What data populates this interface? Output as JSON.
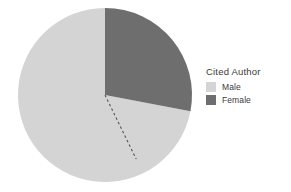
{
  "chart_data": {
    "type": "pie",
    "title": "",
    "legend_title": "Cited Author",
    "legend_position": "right",
    "categories": [
      "Male",
      "Female"
    ],
    "values": [
      72,
      28
    ],
    "unit": "percent",
    "colors": [
      "#d4d4d4",
      "#6e6e6e"
    ],
    "start_angle_deg": 0,
    "direction": "clockwise",
    "annotation": {
      "type": "dashed-radius-line",
      "angle_deg": 154,
      "color": "#555555",
      "style": "dashed"
    },
    "geometry": {
      "center_x": 105,
      "center_y": 95,
      "radius": 87
    }
  },
  "legend": {
    "title": "Cited Author",
    "items": [
      {
        "label": "Male",
        "color": "#d4d4d4"
      },
      {
        "label": "Female",
        "color": "#6e6e6e"
      }
    ]
  },
  "colors": {
    "background": "#ffffff",
    "male": "#d4d4d4",
    "female": "#6e6e6e",
    "text": "#3a3a3a",
    "annotation": "#555555"
  }
}
